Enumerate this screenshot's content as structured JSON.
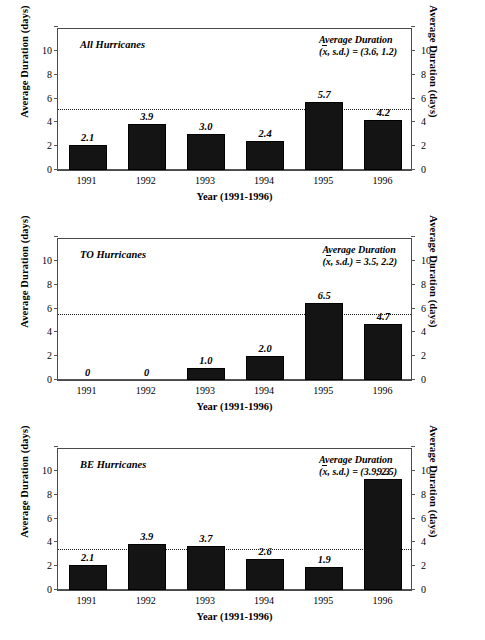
{
  "figure": {
    "panel_count": 3,
    "bar_color": "#141414",
    "frame_color": "#4a4a4a",
    "refline_color": "#1a1a1a"
  },
  "axis": {
    "ylabel_left": "Average Duration (days)",
    "ylabel_right": "Average Duration (days)",
    "xlabel": "Year (1991-1996)",
    "yticks": [
      "0",
      "2",
      "4",
      "6",
      "8",
      "10"
    ],
    "ymin": 0,
    "ymax": 12,
    "categories": [
      "1991",
      "1992",
      "1993",
      "1994",
      "1995",
      "1996"
    ]
  },
  "panels": [
    {
      "id": "all-hurricanes",
      "title": "All Hurricanes",
      "note_line1": "Average Duration",
      "note_prefix": "(",
      "note_symbol": "x",
      "note_suffix": ", s.d.) = (3.6, 1.2)",
      "mean": 3.6,
      "sd": 1.2,
      "refline_value": 5.0,
      "values": [
        2.1,
        3.9,
        3.0,
        2.4,
        5.7,
        4.2
      ],
      "labels": [
        "2.1",
        "3.9",
        "3.0",
        "2.4",
        "5.7",
        "4.2"
      ]
    },
    {
      "id": "to-hurricanes",
      "title": "TO Hurricanes",
      "note_line1": "Average Duration",
      "note_prefix": "(",
      "note_symbol": "x",
      "note_suffix": ", s.d.) = 3.5, 2.2)",
      "mean": 3.5,
      "sd": 2.2,
      "refline_value": 5.45,
      "values": [
        0,
        0,
        1.0,
        2.0,
        6.5,
        4.7
      ],
      "labels": [
        "0",
        "0",
        "1.0",
        "2.0",
        "6.5",
        "4.7"
      ]
    },
    {
      "id": "be-hurricanes",
      "title": "BE Hurricanes",
      "note_line1": "Average Duration",
      "note_prefix": "(",
      "note_symbol": "x",
      "note_suffix": ", s.d.) = (3.9, 2.5)",
      "mean": 3.9,
      "sd": 2.5,
      "refline_value": 3.35,
      "values": [
        2.1,
        3.9,
        3.7,
        2.6,
        1.9,
        9.3
      ],
      "labels": [
        "2.1",
        "3.9",
        "3.7",
        "2.6",
        "1.9",
        "9.3"
      ]
    }
  ],
  "chart_data": {
    "type": "bar",
    "xlabel": "Year (1991-1996)",
    "ylabel": "Average Duration (days)",
    "ylim": [
      0,
      12
    ],
    "yticks": [
      0,
      2,
      4,
      6,
      8,
      10
    ],
    "grid": false,
    "legend": "none",
    "categories": [
      "1991",
      "1992",
      "1993",
      "1994",
      "1995",
      "1996"
    ],
    "panels": [
      {
        "name": "All Hurricanes",
        "values": [
          2.1,
          3.9,
          3.0,
          2.4,
          5.7,
          4.2
        ],
        "mean": 3.6,
        "sd": 1.2,
        "reference_line": 5.0,
        "annotation": "Average Duration (x̄, s.d.) = (3.6, 1.2)"
      },
      {
        "name": "TO Hurricanes",
        "values": [
          0,
          0,
          1.0,
          2.0,
          6.5,
          4.7
        ],
        "mean": 3.5,
        "sd": 2.2,
        "reference_line": 5.45,
        "annotation": "Average Duration (x̄, s.d.) = 3.5, 2.2)"
      },
      {
        "name": "BE Hurricanes",
        "values": [
          2.1,
          3.9,
          3.7,
          2.6,
          1.9,
          9.3
        ],
        "mean": 3.9,
        "sd": 2.5,
        "reference_line": 3.35,
        "annotation": "Average Duration (x̄, s.d.) = (3.9, 2.5)"
      }
    ]
  }
}
